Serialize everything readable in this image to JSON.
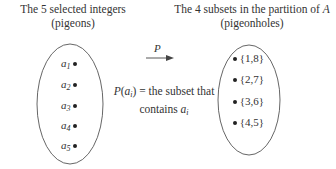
{
  "left": {
    "title_line1": "The 5 selected integers",
    "title_line2": "(pigeons)",
    "elements": [
      {
        "base": "a",
        "sub": "1"
      },
      {
        "base": "a",
        "sub": "2"
      },
      {
        "base": "a",
        "sub": "3"
      },
      {
        "base": "a",
        "sub": "4"
      },
      {
        "base": "a",
        "sub": "5"
      }
    ]
  },
  "right": {
    "title_line1_prefix": "The 4 subsets in the partition of ",
    "title_line1_var": "A",
    "title_line2": "(pigeonholes)",
    "elements": [
      "{1,8}",
      "{2,7}",
      "{3,6}",
      "{4,5}"
    ]
  },
  "mapping": {
    "arrow_label": "P",
    "note_func": "P",
    "note_arg_base": "a",
    "note_arg_sub": "i",
    "note_rest": " = the subset that",
    "note_line2": "contains ",
    "note_line2_var_base": "a",
    "note_line2_var_sub": "i"
  },
  "colors": {
    "stroke": "#555555",
    "text": "#333333",
    "dot": "#222222"
  }
}
